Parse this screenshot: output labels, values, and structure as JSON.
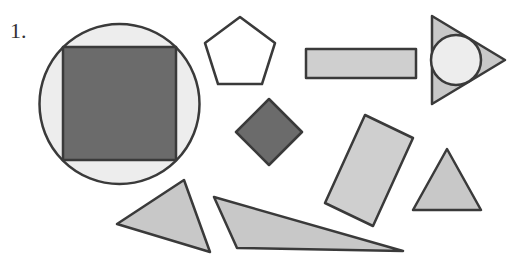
{
  "problem": {
    "number_label": "1."
  },
  "colors": {
    "stroke": "#3a3a3a",
    "dark_fill": "#6b6b6b",
    "light_fill": "#c8c8c8",
    "very_light_fill": "#ededed",
    "white_fill": "#ffffff"
  },
  "shapes": [
    {
      "name": "circle-with-inscribed-square",
      "type": "circle",
      "fill": "very_light"
    },
    {
      "name": "inscribed-square",
      "type": "square",
      "fill": "dark"
    },
    {
      "name": "pentagon",
      "type": "pentagon",
      "fill": "white"
    },
    {
      "name": "horizontal-rectangle",
      "type": "rectangle",
      "fill": "light"
    },
    {
      "name": "triangle-with-inscribed-circle",
      "type": "triangle",
      "fill": "light"
    },
    {
      "name": "inscribed-circle",
      "type": "circle",
      "fill": "very_light"
    },
    {
      "name": "diamond",
      "type": "square",
      "fill": "dark"
    },
    {
      "name": "tilted-rectangle",
      "type": "rectangle",
      "fill": "light"
    },
    {
      "name": "equilateral-triangle",
      "type": "triangle",
      "fill": "light"
    },
    {
      "name": "scalene-triangle",
      "type": "triangle",
      "fill": "light"
    },
    {
      "name": "obtuse-triangle",
      "type": "triangle",
      "fill": "light"
    }
  ]
}
